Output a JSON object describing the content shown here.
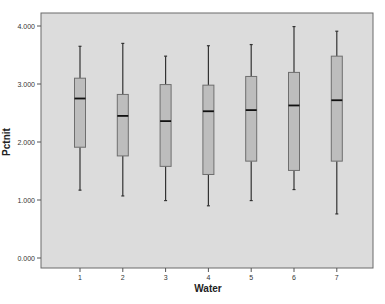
{
  "chart_data": {
    "type": "boxplot",
    "title": "",
    "xlabel": "Water",
    "ylabel": "Pctnit",
    "ylim": [
      0,
      4.2
    ],
    "yticks": [
      "0.000",
      "1.000",
      "2.000",
      "3.000",
      "4.000"
    ],
    "ytick_values": [
      0,
      1,
      2,
      3,
      4
    ],
    "categories": [
      "1",
      "2",
      "3",
      "4",
      "5",
      "6",
      "7"
    ],
    "grid": false,
    "legend": null,
    "series": [
      {
        "name": "Pctnit",
        "boxes": [
          {
            "category": "1",
            "whisker_low": 1.17,
            "q1": 1.91,
            "median": 2.75,
            "q3": 3.1,
            "whisker_high": 3.65
          },
          {
            "category": "2",
            "whisker_low": 1.07,
            "q1": 1.76,
            "median": 2.45,
            "q3": 2.82,
            "whisker_high": 3.7
          },
          {
            "category": "3",
            "whisker_low": 0.99,
            "q1": 1.58,
            "median": 2.36,
            "q3": 2.99,
            "whisker_high": 3.48
          },
          {
            "category": "4",
            "whisker_low": 0.9,
            "q1": 1.44,
            "median": 2.53,
            "q3": 2.98,
            "whisker_high": 3.66
          },
          {
            "category": "5",
            "whisker_low": 0.99,
            "q1": 1.67,
            "median": 2.55,
            "q3": 3.13,
            "whisker_high": 3.68
          },
          {
            "category": "6",
            "whisker_low": 1.18,
            "q1": 1.51,
            "median": 2.63,
            "q3": 3.2,
            "whisker_high": 3.99
          },
          {
            "category": "7",
            "whisker_low": 0.76,
            "q1": 1.67,
            "median": 2.72,
            "q3": 3.48,
            "whisker_high": 3.91
          }
        ]
      }
    ],
    "colors": {
      "plot_background": "#dcdcdc",
      "box_fill": "#bdbdbd",
      "box_stroke": "#6e6e6e",
      "median": "#111111",
      "whisker": "#333333",
      "frame": "#6a6a6a"
    }
  }
}
